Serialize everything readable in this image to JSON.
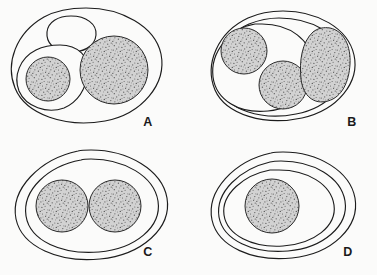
{
  "figure": {
    "background_color": "#fbfbfa",
    "stroke_color": "#1c1c1c",
    "stipple_fill_color": "#c9c9c9",
    "stipple_dot_color": "#4a4a4a",
    "width": 377,
    "height": 275
  },
  "panels": [
    {
      "id": "A",
      "label": "A",
      "label_x": 148,
      "label_y": 126,
      "description": "Outer ovoid enclosing one large stippled sphere, one small stippled sphere within a lobed sub-compartment, and one empty clear vesicle",
      "outer": {
        "cx": 86,
        "cy": 65,
        "rx": 76,
        "ry": 58,
        "rotation": -4
      },
      "compartments": [
        {
          "name": "clear-vesicle",
          "cx": 71,
          "cy": 34,
          "rx": 24,
          "ry": 18,
          "rotation": -6,
          "stippled": false
        },
        {
          "name": "lobed-subcompartment",
          "cx": 52,
          "cy": 77,
          "rx": 35,
          "ry": 30,
          "rotation": 14,
          "stippled": false
        }
      ],
      "spheres": [
        {
          "name": "large-sphere",
          "cx": 114,
          "cy": 70,
          "r": 34,
          "stippled": true
        },
        {
          "name": "small-sphere",
          "cx": 48,
          "cy": 79,
          "r": 22,
          "stippled": true
        }
      ]
    },
    {
      "id": "B",
      "label": "B",
      "label_x": 352,
      "label_y": 126,
      "description": "Outer ovoid with a second inner contour enclosing two stippled spheres on the left; a large reniform stippled mass occupies the right side",
      "outer": {
        "cx": 283,
        "cy": 66,
        "rx": 72,
        "ry": 55,
        "rotation": -3
      },
      "compartments": [
        {
          "name": "inner-contour",
          "cx": 276,
          "cy": 67,
          "rx": 63,
          "ry": 48,
          "rotation": -3,
          "stippled": false
        },
        {
          "name": "left-chamber",
          "cx": 262,
          "cy": 68,
          "rx": 50,
          "ry": 43,
          "rotation": -5,
          "stippled": false
        }
      ],
      "spheres": [
        {
          "name": "upper-left-sphere",
          "cx": 244,
          "cy": 51,
          "r": 23,
          "stippled": true
        },
        {
          "name": "lower-mid-sphere",
          "cx": 283,
          "cy": 85,
          "r": 24,
          "stippled": true
        },
        {
          "name": "right-reniform-mass",
          "cx": 325,
          "cy": 63,
          "rx": 24,
          "ry": 36,
          "rotation": 6,
          "stippled": true
        }
      ]
    },
    {
      "id": "C",
      "label": "C",
      "label_x": 148,
      "label_y": 256,
      "description": "Two concentric ovoid contours enclosing two equal stippled spheres in contact",
      "outer": {
        "cx": 91,
        "cy": 205,
        "rx": 76,
        "ry": 55,
        "rotation": -2
      },
      "compartments": [
        {
          "name": "inner-contour",
          "cx": 91,
          "cy": 205,
          "rx": 67,
          "ry": 46,
          "rotation": -2,
          "stippled": false
        }
      ],
      "spheres": [
        {
          "name": "left-sphere",
          "cx": 62,
          "cy": 206,
          "r": 26,
          "stippled": true
        },
        {
          "name": "right-sphere",
          "cx": 115,
          "cy": 206,
          "r": 26,
          "stippled": true
        }
      ]
    },
    {
      "id": "D",
      "label": "D",
      "label_x": 348,
      "label_y": 256,
      "description": "Three concentric ovoid contours enclosing a single central stippled sphere",
      "outer": {
        "cx": 283,
        "cy": 205,
        "rx": 73,
        "ry": 53,
        "rotation": -2
      },
      "compartments": [
        {
          "name": "middle-contour",
          "cx": 281,
          "cy": 206,
          "rx": 64,
          "ry": 45,
          "rotation": -2,
          "stippled": false
        },
        {
          "name": "inner-contour",
          "cx": 279,
          "cy": 206,
          "rx": 55,
          "ry": 37,
          "rotation": -2,
          "stippled": false
        }
      ],
      "spheres": [
        {
          "name": "central-sphere",
          "cx": 272,
          "cy": 206,
          "r": 27,
          "stippled": true
        }
      ]
    }
  ]
}
